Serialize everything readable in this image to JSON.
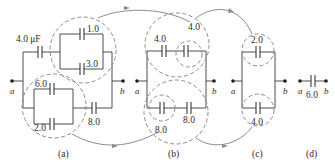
{
  "figure": {
    "panels": [
      {
        "id": "a",
        "caption": "(a)",
        "terminals": {
          "left": "a",
          "right": "b"
        },
        "capacitors": [
          {
            "label": "4.0 μF",
            "value": 4.0
          },
          {
            "label": "1.0",
            "value": 1.0
          },
          {
            "label": "3.0",
            "value": 3.0
          },
          {
            "label": "6.0",
            "value": 6.0
          },
          {
            "label": "2.0",
            "value": 2.0
          },
          {
            "label": "8.0",
            "value": 8.0
          }
        ]
      },
      {
        "id": "b",
        "caption": "(b)",
        "terminals": {
          "left": "a",
          "right": "b"
        },
        "capacitors": [
          {
            "label": "4.0",
            "value": 4.0
          },
          {
            "label": "4.0",
            "value": 4.0
          },
          {
            "label": "8.0",
            "value": 8.0
          },
          {
            "label": "8.0",
            "value": 8.0
          }
        ]
      },
      {
        "id": "c",
        "caption": "(c)",
        "terminals": {
          "left": "a",
          "right": "b"
        },
        "capacitors": [
          {
            "label": "2.0",
            "value": 2.0
          },
          {
            "label": "4.0",
            "value": 4.0
          }
        ]
      },
      {
        "id": "d",
        "caption": "(d)",
        "terminals": {
          "left": "a",
          "right": "b"
        },
        "capacitors": [
          {
            "label": "6.0",
            "value": 6.0
          }
        ]
      }
    ],
    "colors": {
      "wire": "#3a3a3a",
      "dashed_circle": "#8c8c8c",
      "arrow": "#8c8c8c"
    }
  }
}
